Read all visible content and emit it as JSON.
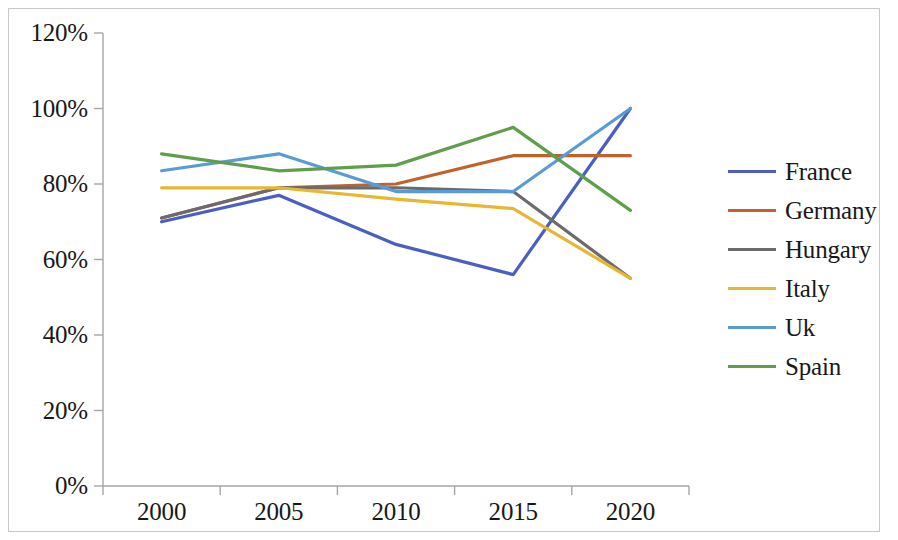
{
  "chart_data": {
    "type": "line",
    "title": "",
    "xlabel": "",
    "ylabel": "",
    "categories": [
      "2000",
      "2005",
      "2010",
      "2015",
      "2020"
    ],
    "ytick_labels": [
      "0%",
      "20%",
      "40%",
      "60%",
      "80%",
      "100%",
      "120%"
    ],
    "ytick_values": [
      0,
      20,
      40,
      60,
      80,
      100,
      120
    ],
    "ylim": [
      0,
      120
    ],
    "grid": false,
    "legend_position": "right",
    "series": [
      {
        "name": "France",
        "color": "#4a5fc1",
        "values": [
          70,
          77,
          64,
          56,
          100
        ]
      },
      {
        "name": "Germany",
        "color": "#c0622c",
        "values": [
          71,
          79,
          80,
          87.5,
          87.5
        ]
      },
      {
        "name": "Hungary",
        "color": "#6b6b6b",
        "values": [
          71,
          79,
          79,
          78,
          55
        ]
      },
      {
        "name": "Italy",
        "color": "#e8b731",
        "values": [
          79,
          79,
          76,
          73.5,
          55
        ]
      },
      {
        "name": "Uk",
        "color": "#5b9bd5",
        "values": [
          83.5,
          88,
          78,
          78,
          100
        ]
      },
      {
        "name": "Spain",
        "color": "#5f9e4a",
        "values": [
          88,
          83.5,
          85,
          95,
          73
        ]
      }
    ]
  },
  "legend": {
    "items": [
      {
        "label": "France"
      },
      {
        "label": "Germany"
      },
      {
        "label": "Hungary"
      },
      {
        "label": "Italy"
      },
      {
        "label": "Uk"
      },
      {
        "label": "Spain"
      }
    ]
  },
  "axes": {
    "y_labels": [
      "120%",
      "100%",
      "80%",
      "60%",
      "40%",
      "20%",
      "0%"
    ],
    "x_labels": [
      "2000",
      "2005",
      "2010",
      "2015",
      "2020"
    ]
  },
  "colors": {
    "axis": "#a6a6a6",
    "border": "#c8c8c8",
    "text": "#181818"
  }
}
